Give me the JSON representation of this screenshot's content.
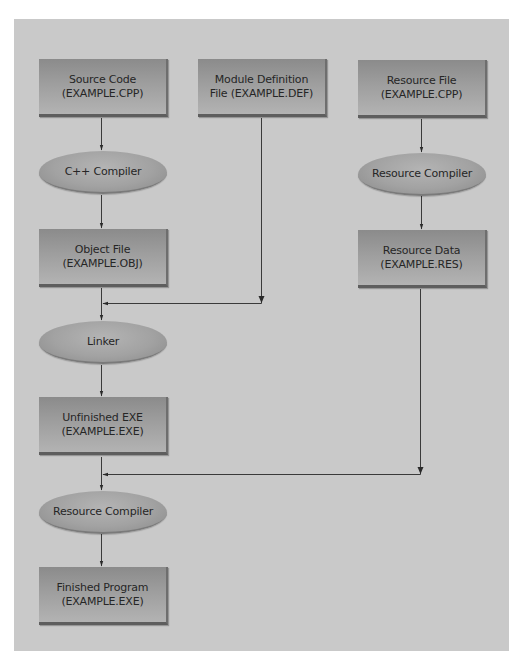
{
  "diagram": {
    "type": "flowchart",
    "colors": {
      "panel_background": "#c9c9c9",
      "box_fill_top": "#8b8b8b",
      "box_fill_bottom": "#b3b3b3",
      "ellipse_fill": "#a2a2a2",
      "line": "#3a3a3a",
      "text": "#262626"
    },
    "nodes": {
      "source_code": {
        "shape": "box",
        "line1": "Source Code",
        "line2": "(EXAMPLE.CPP)"
      },
      "cpp_compiler": {
        "shape": "ellipse",
        "line1": "C++ Compiler"
      },
      "object_file": {
        "shape": "box",
        "line1": "Object File",
        "line2": "(EXAMPLE.OBJ)"
      },
      "linker": {
        "shape": "ellipse",
        "line1": "Linker"
      },
      "unfinished_exe": {
        "shape": "box",
        "line1": "Unfinished EXE",
        "line2": "(EXAMPLE.EXE)"
      },
      "resource_compiler_final": {
        "shape": "ellipse",
        "line1": "Resource Compiler"
      },
      "finished_program": {
        "shape": "box",
        "line1": "Finished Program",
        "line2": "(EXAMPLE.EXE)"
      },
      "module_definition": {
        "shape": "box",
        "line1": "Module Definition",
        "line2": "File (EXAMPLE.DEF)"
      },
      "resource_file": {
        "shape": "box",
        "line1": "Resource File",
        "line2": "(EXAMPLE.CPP)"
      },
      "resource_compiler": {
        "shape": "ellipse",
        "line1": "Resource Compiler"
      },
      "resource_data": {
        "shape": "box",
        "line1": "Resource Data",
        "line2": "(EXAMPLE.RES)"
      }
    },
    "edges": [
      {
        "from": "source_code",
        "to": "cpp_compiler"
      },
      {
        "from": "cpp_compiler",
        "to": "object_file"
      },
      {
        "from": "object_file",
        "to": "linker"
      },
      {
        "from": "module_definition",
        "to": "linker"
      },
      {
        "from": "linker",
        "to": "unfinished_exe"
      },
      {
        "from": "unfinished_exe",
        "to": "resource_compiler_final"
      },
      {
        "from": "resource_data",
        "to": "resource_compiler_final"
      },
      {
        "from": "resource_compiler_final",
        "to": "finished_program"
      },
      {
        "from": "resource_file",
        "to": "resource_compiler"
      },
      {
        "from": "resource_compiler",
        "to": "resource_data"
      }
    ]
  }
}
